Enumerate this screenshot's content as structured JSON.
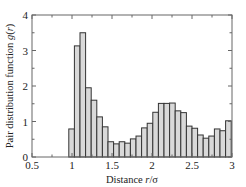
{
  "chart_data": {
    "type": "bar",
    "title": "",
    "xlabel": "Distance r/σ",
    "ylabel": "Pair distribution function g(r)",
    "xlim": [
      0.5,
      3
    ],
    "ylim": [
      0,
      4
    ],
    "xticks": [
      "0.5",
      "1",
      "1.5",
      "2",
      "2.5",
      "3"
    ],
    "yticks": [
      "0",
      "1",
      "2",
      "3",
      "4"
    ],
    "grid": false,
    "legend": null,
    "bin_start": 0.96,
    "bin_width": 0.07,
    "categories": [
      0.995,
      1.065,
      1.135,
      1.205,
      1.275,
      1.345,
      1.415,
      1.485,
      1.555,
      1.625,
      1.695,
      1.765,
      1.835,
      1.905,
      1.975,
      2.045,
      2.115,
      2.185,
      2.255,
      2.325,
      2.395,
      2.465,
      2.535,
      2.605,
      2.675,
      2.745,
      2.815,
      2.885,
      2.955
    ],
    "values": [
      0.79,
      3.13,
      3.5,
      1.95,
      1.6,
      1.13,
      0.85,
      0.43,
      0.37,
      0.43,
      0.39,
      0.51,
      0.59,
      0.82,
      0.95,
      1.26,
      1.51,
      1.51,
      1.52,
      1.3,
      1.25,
      0.87,
      0.81,
      0.62,
      0.53,
      0.59,
      0.79,
      0.74,
      1.02
    ],
    "colors": {
      "bar_fill": "#d9d9d9",
      "bar_edge": "#333333",
      "axis": "#666666"
    }
  }
}
